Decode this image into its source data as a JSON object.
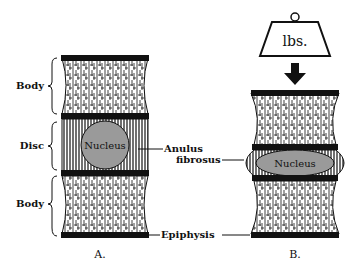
{
  "diagram": {
    "panel_a": {
      "caption": "A.",
      "labels": {
        "body_top": "Body",
        "disc": "Disc",
        "body_bottom": "Body",
        "nucleus": "Nucleus"
      }
    },
    "panel_b": {
      "caption": "B.",
      "weight_label": "lbs.",
      "nucleus": "Nucleus"
    },
    "shared_labels": {
      "anulus_line1": "Anulus",
      "anulus_line2": "fibrosus",
      "epiphysis": "Epiphysis"
    },
    "colors": {
      "ink": "#111111",
      "nucleus_fill": "#9a9a9a",
      "background": "#ffffff"
    }
  }
}
